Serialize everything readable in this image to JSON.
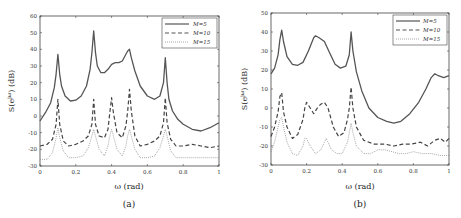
{
  "chart_data": [
    {
      "type": "line",
      "caption": "(a)",
      "xlabel": "ω (rad)",
      "ylabel": "S(e^{jω}) (dB)",
      "xlim": [
        0,
        1
      ],
      "ylim": [
        -30,
        60
      ],
      "xticks": [
        0,
        0.2,
        0.4,
        0.6,
        0.8,
        1
      ],
      "xtick_labels": [
        "0",
        "0.2",
        "0.4",
        "0.6",
        "0.8",
        "1"
      ],
      "yticks": [
        -30,
        -20,
        -10,
        0,
        10,
        20,
        30,
        40,
        50,
        60
      ],
      "grid": false,
      "legend_position": "upper right",
      "series": [
        {
          "name": "M=5",
          "style": "solid",
          "x": [
            0,
            0.03,
            0.06,
            0.08,
            0.09,
            0.1,
            0.11,
            0.12,
            0.14,
            0.17,
            0.2,
            0.23,
            0.26,
            0.28,
            0.29,
            0.3,
            0.31,
            0.32,
            0.34,
            0.36,
            0.38,
            0.4,
            0.42,
            0.44,
            0.46,
            0.48,
            0.49,
            0.5,
            0.51,
            0.53,
            0.56,
            0.6,
            0.64,
            0.67,
            0.69,
            0.7,
            0.71,
            0.72,
            0.74,
            0.77,
            0.8,
            0.85,
            0.9,
            0.95,
            1
          ],
          "values": [
            -3,
            2,
            8,
            17,
            25,
            37,
            25,
            18,
            12,
            9,
            9.5,
            12,
            18,
            28,
            38,
            51,
            38,
            30,
            26,
            26,
            28,
            31,
            32,
            32,
            33,
            37,
            39,
            40,
            35,
            27,
            18,
            12,
            10,
            12,
            20,
            35,
            20,
            10,
            3,
            -2,
            -5,
            -8,
            -9,
            -7,
            -4
          ]
        },
        {
          "name": "M=10",
          "style": "dashed",
          "x": [
            0,
            0.04,
            0.07,
            0.09,
            0.1,
            0.11,
            0.13,
            0.16,
            0.2,
            0.24,
            0.27,
            0.29,
            0.3,
            0.31,
            0.33,
            0.36,
            0.38,
            0.39,
            0.4,
            0.41,
            0.43,
            0.46,
            0.48,
            0.49,
            0.5,
            0.51,
            0.53,
            0.56,
            0.6,
            0.64,
            0.67,
            0.69,
            0.7,
            0.71,
            0.73,
            0.76,
            0.8,
            0.85,
            0.9,
            0.95,
            1
          ],
          "values": [
            -18,
            -17,
            -14,
            -5,
            10,
            -5,
            -15,
            -18,
            -17,
            -15,
            -12,
            -5,
            10,
            -5,
            -12,
            -13,
            -8,
            2,
            11,
            2,
            -10,
            -13,
            -6,
            3,
            16,
            3,
            -12,
            -18,
            -17,
            -15,
            -12,
            -4,
            11,
            -4,
            -14,
            -18,
            -18,
            -17,
            -18,
            -19,
            -18
          ]
        },
        {
          "name": "M=15",
          "style": "dotted",
          "x": [
            0,
            0.04,
            0.07,
            0.09,
            0.1,
            0.11,
            0.13,
            0.16,
            0.2,
            0.24,
            0.27,
            0.29,
            0.3,
            0.31,
            0.33,
            0.36,
            0.38,
            0.39,
            0.4,
            0.41,
            0.43,
            0.46,
            0.48,
            0.49,
            0.5,
            0.51,
            0.53,
            0.56,
            0.6,
            0.64,
            0.67,
            0.69,
            0.7,
            0.71,
            0.73,
            0.76,
            0.8,
            0.85,
            0.9,
            0.95,
            1
          ],
          "values": [
            -26,
            -26,
            -22,
            -13,
            -7,
            -13,
            -21,
            -25,
            -25,
            -24,
            -19,
            -12,
            -8,
            -12,
            -20,
            -24,
            -18,
            -12,
            -8,
            -12,
            -20,
            -24,
            -18,
            -12,
            -8,
            -12,
            -20,
            -25,
            -25,
            -24,
            -19,
            -12,
            -8,
            -12,
            -21,
            -25,
            -25,
            -25,
            -25,
            -25,
            -25
          ]
        }
      ]
    },
    {
      "type": "line",
      "caption": "(b)",
      "xlabel": "ω (rad)",
      "ylabel": "S(e^{jω}) (dB)",
      "xlim": [
        0,
        1
      ],
      "ylim": [
        -30,
        50
      ],
      "xticks": [
        0,
        0.2,
        0.4,
        0.6,
        0.8,
        1
      ],
      "xtick_labels": [
        "0",
        "0.2",
        "0.4",
        "0.6",
        "0.8",
        "1"
      ],
      "yticks": [
        -30,
        -20,
        -10,
        0,
        10,
        20,
        30,
        40,
        50
      ],
      "grid": false,
      "legend_position": "upper right",
      "series": [
        {
          "name": "M=5",
          "style": "solid",
          "x": [
            0,
            0.02,
            0.04,
            0.05,
            0.06,
            0.07,
            0.09,
            0.12,
            0.15,
            0.18,
            0.21,
            0.24,
            0.25,
            0.27,
            0.3,
            0.33,
            0.36,
            0.39,
            0.42,
            0.44,
            0.45,
            0.46,
            0.48,
            0.51,
            0.55,
            0.6,
            0.65,
            0.69,
            0.73,
            0.78,
            0.83,
            0.87,
            0.9,
            0.92,
            0.94,
            0.97,
            1
          ],
          "values": [
            18,
            21,
            28,
            36,
            41,
            35,
            27,
            23,
            22.5,
            24,
            30,
            37,
            38,
            37,
            35,
            29,
            23,
            21,
            22,
            28,
            40,
            30,
            19,
            9,
            0,
            -5,
            -7,
            -8,
            -7,
            -3,
            3,
            10,
            16,
            18,
            17,
            16,
            17
          ]
        },
        {
          "name": "M=10",
          "style": "dashed",
          "x": [
            0,
            0.02,
            0.04,
            0.05,
            0.06,
            0.07,
            0.09,
            0.12,
            0.15,
            0.18,
            0.19,
            0.2,
            0.22,
            0.24,
            0.26,
            0.28,
            0.3,
            0.32,
            0.35,
            0.38,
            0.41,
            0.43,
            0.44,
            0.45,
            0.46,
            0.48,
            0.52,
            0.58,
            0.64,
            0.69,
            0.74,
            0.79,
            0.84,
            0.88,
            0.92,
            0.95,
            0.98,
            1
          ],
          "values": [
            -15,
            -10,
            -2,
            6,
            8,
            -2,
            -10,
            -16,
            -14,
            -6,
            0,
            3,
            0,
            -3,
            0,
            2,
            3,
            0,
            -10,
            -15,
            -13,
            -6,
            0,
            11,
            0,
            -10,
            -17,
            -19,
            -19,
            -20,
            -19,
            -19,
            -18,
            -20,
            -17,
            -16,
            -18,
            -16
          ]
        },
        {
          "name": "M=15",
          "style": "dotted",
          "x": [
            0,
            0.02,
            0.04,
            0.05,
            0.06,
            0.07,
            0.09,
            0.12,
            0.15,
            0.18,
            0.19,
            0.2,
            0.22,
            0.25,
            0.28,
            0.3,
            0.31,
            0.32,
            0.34,
            0.37,
            0.4,
            0.43,
            0.44,
            0.45,
            0.46,
            0.48,
            0.52,
            0.56,
            0.6,
            0.64,
            0.68,
            0.72,
            0.76,
            0.8,
            0.85,
            0.9,
            0.95,
            1
          ],
          "values": [
            -23,
            -18,
            -10,
            -6,
            -5,
            -10,
            -18,
            -24,
            -25,
            -20,
            -16,
            -16,
            -20,
            -24,
            -22,
            -18,
            -16,
            -18,
            -22,
            -24,
            -24,
            -18,
            -13,
            -8,
            -13,
            -20,
            -24,
            -24,
            -22,
            -22,
            -23,
            -24,
            -24,
            -23,
            -24,
            -24,
            -25,
            -25
          ]
        }
      ]
    }
  ]
}
